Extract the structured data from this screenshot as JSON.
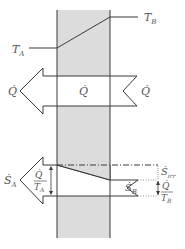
{
  "diagram": {
    "colors": {
      "wall_fill": "#dcdcdc",
      "line": "#3a3a3a",
      "text": "#555555"
    },
    "temperature_profile": {
      "left_label": "T",
      "left_subscript": "A",
      "right_label": "T",
      "right_subscript": "B"
    },
    "heat_flow": {
      "left_label": "Q̇",
      "center_label": "Q̇",
      "right_label": "Q̇"
    },
    "entropy_flow": {
      "left_label": "Ṡ",
      "left_subscript": "A",
      "right_label": "Ṡ",
      "right_subscript": "B",
      "generated_label": "Ṡ",
      "generated_subscript": "irr",
      "left_fraction_num": "Q̇",
      "left_fraction_den_T": "T",
      "left_fraction_den_sub": "A",
      "right_fraction_num": "Q̇",
      "right_fraction_den_T": "T",
      "right_fraction_den_sub": "B"
    }
  }
}
